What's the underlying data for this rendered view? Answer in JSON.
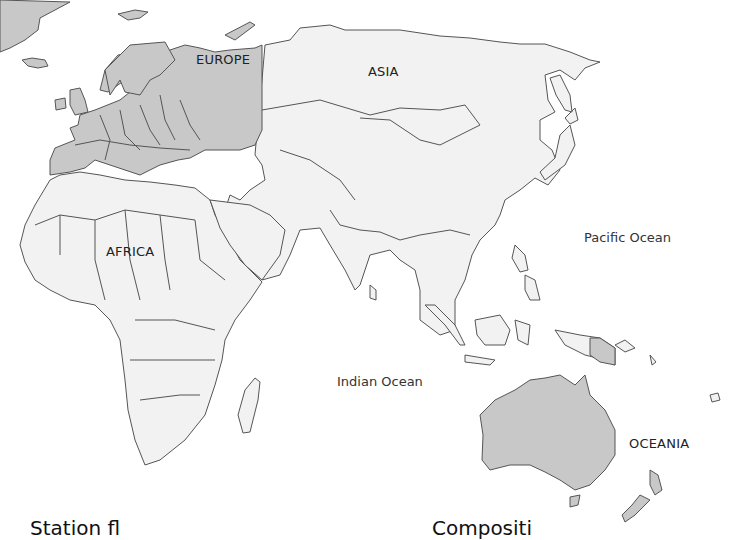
{
  "map": {
    "type": "world-map-eastern-hemisphere",
    "colors": {
      "highlight_fill": "#c8c8c8",
      "land_fill": "#f2f2f2",
      "border": "#555555",
      "water": "#ffffff"
    },
    "highlighted_regions": [
      "Europe",
      "Oceania (Australia, New Guinea east, New Zealand)",
      "Greenland"
    ],
    "labels": {
      "europe": "EUROPE",
      "asia": "ASIA",
      "africa": "AFRICA",
      "oceania": "OCEANIA",
      "pacific": "Pacific Ocean",
      "indian": "Indian Ocean"
    }
  },
  "footer": {
    "left_text": "Station fl",
    "right_text": "Compositi"
  }
}
